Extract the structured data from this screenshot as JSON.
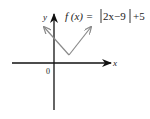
{
  "figure": {
    "function_label": "f (x) = |2x−9| +5",
    "function_parts": {
      "fx": "f (x) =",
      "inner": "2x−9",
      "tail": "+5"
    },
    "x_axis_label": "x",
    "y_axis_label": "y",
    "origin_label": "0",
    "colors": {
      "axes": "#111111",
      "graph": "#8a8a8a",
      "text": "#222222"
    }
  }
}
